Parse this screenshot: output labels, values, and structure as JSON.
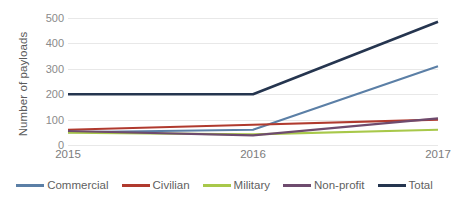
{
  "chart_data": {
    "type": "line",
    "title": "",
    "xlabel": "",
    "ylabel": "Number of payloads",
    "categories": [
      "2015",
      "2016",
      "2017"
    ],
    "ylim": [
      0,
      500
    ],
    "yticks": [
      0,
      100,
      200,
      300,
      400,
      500
    ],
    "grid": true,
    "legend_position": "bottom",
    "series": [
      {
        "name": "Commercial",
        "color": "#5B7FA6",
        "values": [
          50,
          60,
          310
        ]
      },
      {
        "name": "Civilian",
        "color": "#B03A2E",
        "values": [
          60,
          80,
          100
        ]
      },
      {
        "name": "Military",
        "color": "#A8C84A",
        "values": [
          48,
          42,
          60
        ]
      },
      {
        "name": "Non-profit",
        "color": "#6E4B6E",
        "values": [
          55,
          38,
          105
        ]
      },
      {
        "name": "Total",
        "color": "#253category",
        "values": [
          200,
          200,
          485
        ]
      }
    ]
  },
  "axes": {
    "y_title": "Number of payloads",
    "y_tick_labels": [
      "500",
      "400",
      "300",
      "200",
      "100",
      "0"
    ],
    "x_tick_labels": [
      "2015",
      "2016",
      "2017"
    ]
  },
  "legend": {
    "items": [
      {
        "label": "Commercial",
        "color": "#5B7FA6"
      },
      {
        "label": "Civilian",
        "color": "#B03A2E"
      },
      {
        "label": "Military",
        "color": "#A8C84A"
      },
      {
        "label": "Non-profit",
        "color": "#6E4B6E"
      },
      {
        "label": "Total",
        "color": "#25354F"
      }
    ]
  },
  "colors": {
    "background": "#FFFFFF",
    "gridline": "#E8E8E8",
    "tick_text": "#8A8A8A",
    "axis_title_text": "#5A5A5A",
    "legend_text": "#5F5F5F",
    "commercial": "#5B7FA6",
    "civilian": "#B03A2E",
    "military": "#A8C84A",
    "nonprofit": "#6E4B6E",
    "total": "#25354F"
  }
}
